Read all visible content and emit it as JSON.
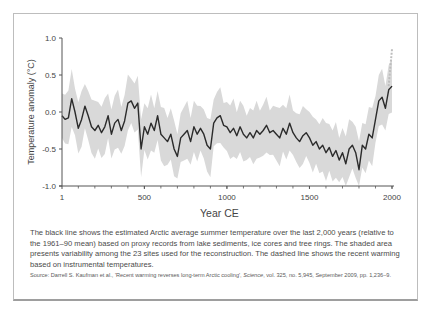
{
  "figure": {
    "caption": "The black line shows the estimated Arctic average summer temperature over the last 2,000 years (relative to the 1961–90 mean) based on proxy records from lake sediments, ice cores and tree rings. The shaded area presents variability among the 23 sites used for the reconstruction. The dashed line shows the recent warming based on instrumental temperatures.",
    "source_prefix": "Source: Darrell S. Kaufman et al., 'Recent warming reverses long-term Arctic cooling', ",
    "source_journal": "Science",
    "source_suffix": ", vol. 325, no. 5,945, September 2009, pp. 1,236–9."
  },
  "chart_data": {
    "type": "line",
    "title": "",
    "xlabel": "Year CE",
    "ylabel": "Temperature anomaly (°C)",
    "xlim": [
      1,
      2000
    ],
    "ylim": [
      -1.0,
      1.0
    ],
    "x_ticks": [
      "1",
      "500",
      "1000",
      "1500",
      "2000"
    ],
    "y_ticks": [
      "1.0",
      "0.5",
      "0.0",
      "-0.5",
      "-1.0"
    ],
    "grid": false,
    "legend": null,
    "colors": {
      "line": "#2b2b2b",
      "band": "#d9d9d9",
      "instrumental": "#bdbdbd",
      "axis": "#555555"
    },
    "series": [
      {
        "name": "Reconstructed Arctic summer temperature (black line)",
        "x": [
          1,
          20,
          40,
          60,
          80,
          100,
          120,
          140,
          160,
          180,
          200,
          220,
          240,
          260,
          280,
          300,
          320,
          340,
          360,
          380,
          400,
          420,
          440,
          460,
          480,
          500,
          520,
          540,
          560,
          580,
          600,
          620,
          640,
          660,
          680,
          700,
          720,
          740,
          760,
          780,
          800,
          820,
          840,
          860,
          880,
          900,
          920,
          940,
          960,
          980,
          1000,
          1020,
          1040,
          1060,
          1080,
          1100,
          1120,
          1140,
          1160,
          1180,
          1200,
          1220,
          1240,
          1260,
          1280,
          1300,
          1320,
          1340,
          1360,
          1380,
          1400,
          1420,
          1440,
          1460,
          1480,
          1500,
          1520,
          1540,
          1560,
          1580,
          1600,
          1620,
          1640,
          1660,
          1680,
          1700,
          1720,
          1740,
          1760,
          1780,
          1800,
          1820,
          1840,
          1860,
          1880,
          1900,
          1920,
          1940,
          1960,
          1980,
          2000
        ],
        "values": [
          -0.05,
          -0.1,
          -0.08,
          0.18,
          0.0,
          -0.22,
          -0.1,
          0.08,
          -0.05,
          -0.2,
          -0.25,
          -0.18,
          -0.28,
          -0.2,
          -0.05,
          -0.3,
          -0.15,
          -0.1,
          -0.25,
          -0.12,
          0.12,
          0.15,
          0.05,
          0.12,
          -0.5,
          -0.2,
          -0.3,
          -0.15,
          -0.25,
          -0.05,
          -0.3,
          -0.35,
          -0.4,
          -0.3,
          -0.5,
          -0.6,
          -0.35,
          -0.3,
          -0.25,
          -0.4,
          -0.2,
          -0.3,
          -0.22,
          -0.3,
          -0.45,
          -0.5,
          -0.15,
          -0.08,
          -0.05,
          -0.18,
          -0.2,
          -0.28,
          -0.22,
          -0.32,
          -0.2,
          -0.3,
          -0.35,
          -0.28,
          -0.35,
          -0.25,
          -0.3,
          -0.25,
          -0.18,
          -0.28,
          -0.25,
          -0.3,
          -0.35,
          -0.22,
          -0.3,
          -0.15,
          -0.28,
          -0.35,
          -0.4,
          -0.32,
          -0.28,
          -0.35,
          -0.45,
          -0.4,
          -0.5,
          -0.45,
          -0.55,
          -0.48,
          -0.6,
          -0.52,
          -0.65,
          -0.55,
          -0.7,
          -0.5,
          -0.45,
          -0.55,
          -0.78,
          -0.45,
          -0.5,
          -0.3,
          -0.35,
          -0.1,
          0.15,
          0.2,
          0.05,
          0.3,
          0.35
        ]
      },
      {
        "name": "Instrumental temperatures (dashed line)",
        "x": [
          1980,
          1990,
          2000
        ],
        "values": [
          0.35,
          0.6,
          0.85
        ]
      },
      {
        "name": "Variability among 23 sites (shaded area, approx ±)",
        "x": [
          1,
          2000
        ],
        "values": [
          0.3,
          0.3
        ]
      }
    ]
  }
}
